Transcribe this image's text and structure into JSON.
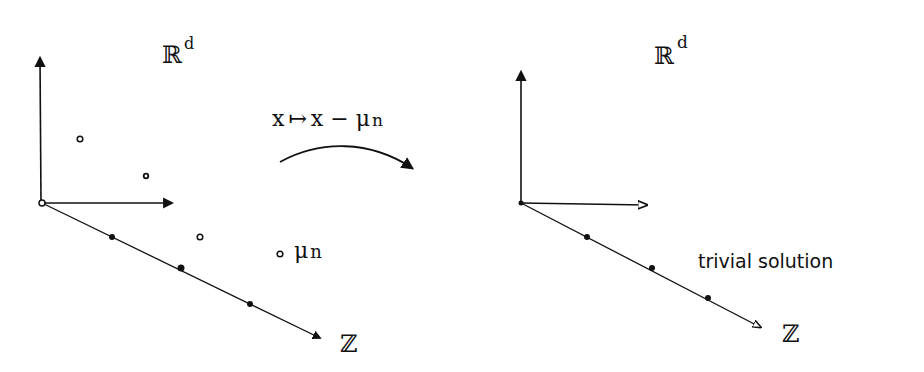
{
  "colors": {
    "ink": "#111111",
    "background": "#ffffff"
  },
  "left_panel": {
    "space_label": {
      "base": "ℝ",
      "sup": "d"
    },
    "z_label": "ℤ",
    "mean_label": "μ",
    "mean_sub": "n",
    "points_count": 4,
    "lattice_dots_count": 3
  },
  "transform": {
    "label_x": "x",
    "label_mapsto": "↦",
    "label_rhs": "x − μ",
    "label_sub": "n"
  },
  "right_panel": {
    "space_label": {
      "base": "ℝ",
      "sup": "d"
    },
    "z_label": "ℤ",
    "caption": "trivial solution",
    "lattice_dots_count": 3
  }
}
